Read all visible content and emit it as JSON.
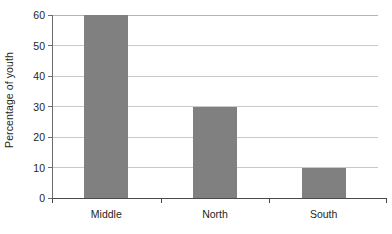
{
  "chart_data": {
    "type": "bar",
    "title": "",
    "subtitle": "",
    "xlabel": "",
    "ylabel": "Percentage of youth",
    "categories": [
      "Middle",
      "North",
      "South"
    ],
    "values": [
      60,
      30,
      10
    ],
    "series": [
      {
        "name": "Percentage of youth",
        "values": [
          60,
          30,
          10
        ]
      }
    ],
    "ylim": [
      0,
      60
    ],
    "xlim_categories": 3,
    "y_ticks": [
      0,
      10,
      20,
      30,
      40,
      50,
      60
    ],
    "y_tick_labels": [
      "0",
      "10",
      "20",
      "30",
      "40",
      "50",
      "60"
    ],
    "grid": "horizontal",
    "legend": "none",
    "legend_position": "none",
    "annotations": [],
    "colors": {
      "bar_fill": "#808080",
      "gridline": "#c9c9c9",
      "axis": "#4a4a4a",
      "text": "#231f20",
      "background": "#ffffff"
    }
  },
  "axes": {
    "y_title": "Percentage of youth",
    "y_tick_labels": [
      "60",
      "50",
      "40",
      "30",
      "20",
      "10",
      "0"
    ],
    "x_tick_labels": [
      "Middle",
      "North",
      "South"
    ]
  },
  "bars": [
    {
      "label": "Middle",
      "value": 60,
      "value_text": "60"
    },
    {
      "label": "North",
      "value": 30,
      "value_text": "30"
    },
    {
      "label": "South",
      "value": 10,
      "value_text": "10"
    }
  ]
}
